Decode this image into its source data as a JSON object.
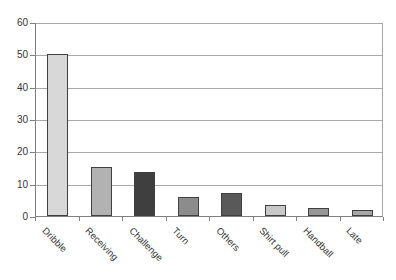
{
  "chart_data": {
    "type": "bar",
    "title": "",
    "xlabel": "",
    "ylabel": "",
    "categories": [
      "Dribble",
      "Receiving",
      "Challenge",
      "Turn",
      "Others",
      "Shirt pull",
      "Handball",
      "Late"
    ],
    "values": [
      50,
      15,
      13.5,
      6,
      7,
      3.5,
      2.5,
      2
    ],
    "bar_colors": [
      "#d8d8d8",
      "#b2b2b2",
      "#3f3f3f",
      "#8c8c8c",
      "#595959",
      "#c8c8c8",
      "#969696",
      "#a8a8a8"
    ],
    "bar_border_color": "#404040",
    "y_ticks": [
      0,
      10,
      20,
      30,
      40,
      50,
      60
    ],
    "ylim": [
      0,
      60
    ],
    "grid": "horizontal",
    "gridline_color": "#a8a8a8",
    "axis_color": "#808080",
    "background_color": "#ffffff",
    "legend_position": "none",
    "x_label_rotation_deg": 45
  }
}
